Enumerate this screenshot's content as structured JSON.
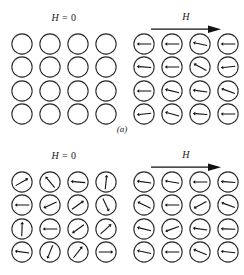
{
  "figure": {
    "width": 244,
    "height": 275,
    "stroke_color": "#2b2b2b",
    "background_color": "#ffffff"
  },
  "chart_data": {
    "type": "diagram",
    "subfigures": [
      {
        "caption": "(a)",
        "description": "Diamagnetic or paramagnetic-free material: no net moments at H = 0, moments align with field when H applied",
        "panels": [
          {
            "field_label": "H = 0",
            "has_field_arrow": false,
            "rows": 4,
            "cols": 4,
            "moments": [
              [
                null,
                null,
                null,
                null
              ],
              [
                null,
                null,
                null,
                null
              ],
              [
                null,
                null,
                null,
                null
              ],
              [
                null,
                null,
                null,
                null
              ]
            ]
          },
          {
            "field_label": "H",
            "has_field_arrow": true,
            "rows": 4,
            "cols": 4,
            "moments": [
              [
                180,
                180,
                168,
                180
              ],
              [
                176,
                180,
                152,
                186
              ],
              [
                180,
                166,
                172,
                160
              ],
              [
                186,
                164,
                176,
                180
              ]
            ]
          }
        ]
      },
      {
        "caption": "(b)",
        "description": "Ferromagnetic material: randomly oriented moments at H = 0, aligned with field when H applied",
        "panels": [
          {
            "field_label": "H = 0",
            "has_field_arrow": false,
            "rows": 4,
            "cols": 4,
            "moments": [
              [
                30,
                130,
                175,
                84
              ],
              [
                180,
                205,
                35,
                295
              ],
              [
                88,
                180,
                215,
                42
              ],
              [
                172,
                248,
                52,
                0
              ]
            ]
          },
          {
            "field_label": "H",
            "has_field_arrow": true,
            "rows": 4,
            "cols": 4,
            "moments": [
              [
                172,
                170,
                180,
                176
              ],
              [
                154,
                180,
                208,
                160
              ],
              [
                166,
                200,
                172,
                178
              ],
              [
                168,
                180,
                158,
                174
              ]
            ]
          }
        ]
      }
    ]
  },
  "labels": {
    "field_zero": "H = 0",
    "field_zero_symbol": "H",
    "field_zero_equals": " = 0",
    "field_applied": "H",
    "caption_a": "(a)",
    "caption_b": "(b)"
  }
}
